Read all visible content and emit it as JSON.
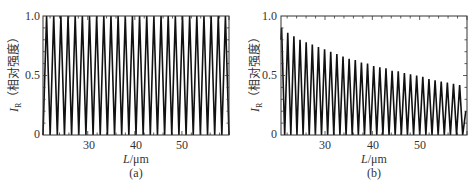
{
  "chart_data": [
    {
      "type": "line",
      "panel": "(a)",
      "caption": "(a)",
      "title": "",
      "xlabel": "L/μm",
      "ylabel": "I_R（相对强度）",
      "xlim": [
        20.5,
        60
      ],
      "ylim": [
        0,
        1.0
      ],
      "xticks": [
        30,
        40,
        50
      ],
      "yticks": [
        "0",
        "0.5",
        "1.0"
      ],
      "grid": false,
      "description": "Periodic full-contrast oscillation between 0 and 1.0, ~26 periods across the range (period ≈ 1.5 μm)",
      "series": [
        {
          "name": "I_R",
          "period_um": 1.52,
          "min": 0,
          "max": 1.0,
          "peak_count": 26
        }
      ]
    },
    {
      "type": "line",
      "panel": "(b)",
      "caption": "(b)",
      "title": "",
      "xlabel": "L/μm",
      "ylabel": "I_R（相对强度）",
      "xlim": [
        20.7,
        60
      ],
      "ylim": [
        0,
        1.0
      ],
      "xticks": [
        30,
        40,
        50
      ],
      "yticks": [
        "0",
        "0.5",
        "1.0"
      ],
      "grid": false,
      "description": "Oscillation between 0 and a decaying envelope; peak heights decrease from ~0.9 to ~0.42",
      "series": [
        {
          "name": "I_R",
          "period_um": 1.3,
          "min": 0,
          "peak_values": [
            0.9,
            0.86,
            0.83,
            0.8,
            0.78,
            0.76,
            0.74,
            0.72,
            0.7,
            0.68,
            0.66,
            0.64,
            0.63,
            0.61,
            0.6,
            0.58,
            0.57,
            0.56,
            0.54,
            0.535,
            0.52,
            0.51,
            0.5,
            0.49,
            0.47,
            0.46,
            0.45,
            0.44,
            0.43,
            0.42
          ],
          "end_value": 0.2
        }
      ]
    }
  ],
  "panels": {
    "a": {
      "caption": "(a)",
      "xlabel_var": "L",
      "xlabel_unit": "/μm",
      "ylabel_var": "I",
      "ylabel_sub": "R",
      "ylabel_text": "（相对强度）",
      "yticks": [
        "1.0",
        "0.5",
        "0"
      ],
      "xticks": [
        "30",
        "40",
        "50"
      ]
    },
    "b": {
      "caption": "(b)",
      "xlabel_var": "L",
      "xlabel_unit": "/μm",
      "ylabel_var": "I",
      "ylabel_sub": "R",
      "ylabel_text": "（相对强度）",
      "yticks": [
        "1.0",
        "0.5",
        "0"
      ],
      "xticks": [
        "30",
        "40",
        "50"
      ]
    }
  }
}
